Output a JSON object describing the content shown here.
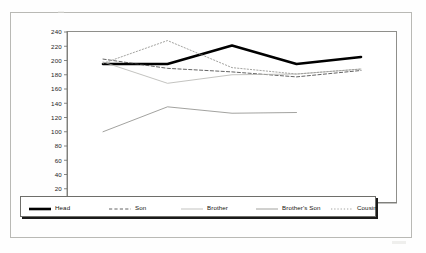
{
  "page": {
    "background_color": "#fefefe",
    "frame_color": "#b9b9b5"
  },
  "chart_data": {
    "type": "line",
    "title": "",
    "subtitle": "",
    "xlabel": "",
    "ylabel": "",
    "categories": [
      "21-25",
      "26-30",
      "31-35",
      "36-40",
      "41-45"
    ],
    "ylim": [
      0,
      240
    ],
    "yticks": [
      0,
      20,
      40,
      60,
      80,
      100,
      120,
      140,
      160,
      180,
      200,
      220,
      240
    ],
    "ytick_labels": [
      "0",
      "20",
      "40",
      "60",
      "80",
      "100",
      "120",
      "140",
      "160",
      "180",
      "200",
      "220",
      "240"
    ],
    "grid": false,
    "legend_position": "bottom",
    "series": [
      {
        "name": "Head",
        "style": "solid-thick",
        "color": "#000000",
        "width": 2.6,
        "values": [
          195,
          195,
          221,
          195,
          205
        ]
      },
      {
        "name": "Son",
        "style": "dashed",
        "color": "#3c3c3c",
        "width": 0.8,
        "values": [
          202,
          189,
          184,
          177,
          186
        ]
      },
      {
        "name": "Brother",
        "style": "solid-light",
        "color": "#b4b4b0",
        "width": 0.8,
        "values": [
          198,
          168,
          180,
          181,
          188
        ]
      },
      {
        "name": "Brother's Son",
        "style": "solid-thin",
        "color": "#8a8a86",
        "width": 0.8,
        "values": [
          100,
          135,
          126,
          127,
          null
        ]
      },
      {
        "name": "Cousin",
        "style": "dotted",
        "color": "#9a9a96",
        "width": 0.9,
        "values": [
          196,
          228,
          190,
          181,
          188
        ]
      }
    ]
  },
  "legend": {
    "items": [
      {
        "label": "Head"
      },
      {
        "label": "Son"
      },
      {
        "label": "Brother"
      },
      {
        "label": "Brother's Son"
      },
      {
        "label": "Cousin"
      }
    ]
  }
}
